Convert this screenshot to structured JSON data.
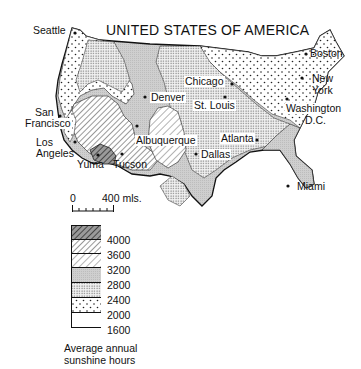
{
  "title": "UNITED STATES OF AMERICA",
  "cities": [
    {
      "name": "Seattle",
      "label": "Seattle"
    },
    {
      "name": "San Francisco",
      "label_line1": "San",
      "label_line2": "Francisco"
    },
    {
      "name": "Los Angeles",
      "label_line1": "Los",
      "label_line2": "Angeles"
    },
    {
      "name": "Yuma",
      "label": "Yuma"
    },
    {
      "name": "Tucson",
      "label": "Tucson"
    },
    {
      "name": "Albuquerque",
      "label": "Albuquerque"
    },
    {
      "name": "Denver",
      "label": "Denver"
    },
    {
      "name": "Dallas",
      "label": "Dallas"
    },
    {
      "name": "St. Louis",
      "label": "St. Louis"
    },
    {
      "name": "Chicago",
      "label": "Chicago"
    },
    {
      "name": "Atlanta",
      "label": "Atlanta"
    },
    {
      "name": "Miami",
      "label": "Miami"
    },
    {
      "name": "Boston",
      "label": "Boston"
    },
    {
      "name": "New York",
      "label_line1": "New",
      "label_line2": "York"
    },
    {
      "name": "Washington D.C.",
      "label_line1": "Washington",
      "label_line2": "D.C."
    }
  ],
  "scale_bar": {
    "start": "0",
    "end": "400 mls."
  },
  "legend": {
    "caption_line1": "Average annual",
    "caption_line2": "sunshine hours",
    "classes": [
      {
        "range": "4000+",
        "pattern": "dense-hatch-dark"
      },
      {
        "range": "3600-4000",
        "pattern": "hatch"
      },
      {
        "range": "3200-3600",
        "pattern": "hatch-light"
      },
      {
        "range": "2800-3200",
        "pattern": "grey-fill"
      },
      {
        "range": "2400-2800",
        "pattern": "dense-dots"
      },
      {
        "range": "2000-2400",
        "pattern": "sparse-dots"
      },
      {
        "range": "1600-2000",
        "pattern": "white"
      }
    ],
    "ticks": [
      "4000",
      "3600",
      "3200",
      "2800",
      "2400",
      "2000",
      "1600"
    ]
  }
}
